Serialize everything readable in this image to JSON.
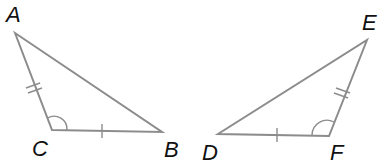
{
  "diagram": {
    "colors": {
      "edge": "#8c8c8c",
      "label": "#111111",
      "background": "#ffffff"
    },
    "triangle1": {
      "vertices": {
        "A": {
          "label": "A",
          "x": 15,
          "y": 33
        },
        "C": {
          "label": "C",
          "x": 52,
          "y": 130
        },
        "B": {
          "label": "B",
          "x": 162,
          "y": 132
        }
      },
      "marks": {
        "AC": "double-tick",
        "CB": "single-tick",
        "angleC": "arc"
      }
    },
    "triangle2": {
      "vertices": {
        "E": {
          "label": "E",
          "x": 367,
          "y": 40
        },
        "F": {
          "label": "F",
          "x": 329,
          "y": 136
        },
        "D": {
          "label": "D",
          "x": 218,
          "y": 134
        }
      },
      "marks": {
        "EF": "double-tick",
        "FD": "single-tick",
        "angleF": "arc"
      }
    }
  }
}
